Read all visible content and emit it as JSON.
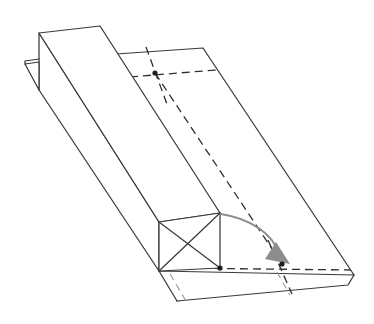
{
  "figure": {
    "canvas": {
      "width": 374,
      "height": 324,
      "background": "#ffffff"
    },
    "colors": {
      "solid_line": "#3a3a3a",
      "hidden_line": "#2f2f2f",
      "faint_hidden_line": "#9a9a9a",
      "motion_arrow": "#8d8d8d",
      "vertex_dot": "#1c1c1c",
      "face_fill": "#ffffff"
    },
    "labels": [],
    "annotations": []
  },
  "geometry": {
    "ramp_top_face": {
      "name": "inclined-ramp-top-face",
      "points": "116,54 203,48 354,275 177,301"
    },
    "ramp_lower_lip": {
      "name": "ramp-lower-lip-face",
      "points": "159,271 354,275 348,285 177,301"
    },
    "beam_top_face": {
      "name": "beam-top-face",
      "points": "39,33 100,26 220,213 159,222"
    },
    "beam_side_face": {
      "name": "beam-left-side-face",
      "points": "39,33 39,90 159,271 159,222"
    },
    "beam_front_face": {
      "name": "beam-front-face",
      "points": "159,222 220,213 220,268 159,271"
    },
    "beam_notch": {
      "name": "beam-rear-notch",
      "points": "39,62 25,64 39,90"
    },
    "beam_notch_edge": {
      "name": "beam-notch-lower-edge",
      "points": "25,64 25,61 39,59"
    },
    "front_face_diagonals": [
      {
        "name": "front-face-diagonal-a",
        "points": "159,222 220,268"
      },
      {
        "name": "front-face-diagonal-b",
        "points": "220,213 159,271"
      }
    ],
    "hidden_lines": [
      {
        "name": "hidden-line-upper-cross-horizontal",
        "points": "117,78 216,70"
      },
      {
        "name": "hidden-line-upper-cross-vertical",
        "points": "146,47 168,107"
      },
      {
        "name": "hidden-line-long-slide-path",
        "points": "155,73 282,264"
      },
      {
        "name": "hidden-line-lower-cross-horizontal",
        "points": "175,268 351,270"
      },
      {
        "name": "hidden-line-lower-cross-vertical",
        "points": "268,240 292,294"
      }
    ],
    "faint_hidden_lines": [
      {
        "name": "faint-hidden-line-left-seam",
        "points": "170,274 186,301"
      },
      {
        "name": "faint-hidden-line-right-seam",
        "points": "277,272 290,295"
      }
    ],
    "vertex_dots": [
      {
        "name": "vertex-dot-ramp-upper-target",
        "cx": 155,
        "cy": 73,
        "r": 2.6
      },
      {
        "name": "vertex-dot-block-base-front",
        "cx": 220,
        "cy": 268,
        "r": 2.6
      },
      {
        "name": "vertex-dot-slide-destination",
        "cx": 282,
        "cy": 264,
        "r": 2.6
      }
    ],
    "motion_arrow": {
      "name": "sliding-motion-arrow",
      "path": "M 221,214 C 252,219 272,234 279,253",
      "head": "276,242 290,264 265,259"
    }
  }
}
